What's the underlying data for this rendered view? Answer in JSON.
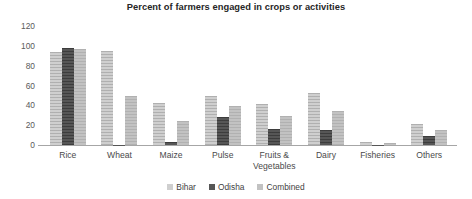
{
  "chart_data": {
    "type": "bar",
    "title": "Percent of farmers engaged in crops or activities",
    "xlabel": "",
    "ylabel": "",
    "ylim": [
      0,
      120
    ],
    "yticks": [
      0,
      20,
      40,
      60,
      80,
      100,
      120
    ],
    "grid": false,
    "legend_position": "bottom",
    "categories": [
      "Rice",
      "Wheat",
      "Maize",
      "Pulse",
      "Fruits &\nVegetables",
      "Dairy",
      "Fisheries",
      "Others"
    ],
    "series": [
      {
        "name": "Bihar",
        "color": "#cfcfcf",
        "values": [
          94,
          95,
          42,
          49,
          41,
          52,
          3,
          21
        ]
      },
      {
        "name": "Odisha",
        "color": "#565656",
        "values": [
          98,
          0.4,
          3,
          28,
          16,
          15,
          0.4,
          9
        ]
      },
      {
        "name": "Combined",
        "color": "#c2c2c2",
        "values": [
          97,
          49,
          24,
          39,
          29,
          34,
          2,
          15
        ]
      }
    ]
  }
}
